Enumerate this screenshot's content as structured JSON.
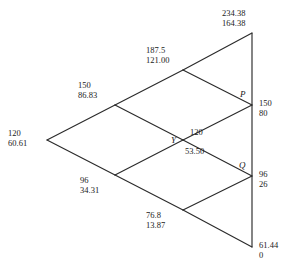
{
  "diagram": {
    "type": "binomial-lattice",
    "title": "",
    "edge_color": "#2b2b2b",
    "text_color": "#1a1a1a",
    "nodes": [
      {
        "id": "root",
        "name": "node-root",
        "x": 47,
        "y": 140,
        "value_top": "120",
        "value_bottom": "60.61",
        "label_x": 8,
        "label_y": 128,
        "point_label": "",
        "layout": "stacked"
      },
      {
        "id": "up1",
        "name": "node-up1",
        "x": 115,
        "y": 105,
        "value_top": "150",
        "value_bottom": "86.83",
        "label_x": 78,
        "label_y": 80,
        "point_label": "",
        "layout": "stacked"
      },
      {
        "id": "down1",
        "name": "node-down1",
        "x": 115,
        "y": 175,
        "value_top": "96",
        "value_bottom": "34.31",
        "label_x": 80,
        "label_y": 175,
        "point_label": "",
        "layout": "stacked"
      },
      {
        "id": "upup2",
        "name": "node-upup2",
        "x": 183,
        "y": 70,
        "value_top": "187.5",
        "value_bottom": "121.00",
        "label_x": 146,
        "label_y": 45,
        "point_label": "",
        "layout": "stacked"
      },
      {
        "id": "mid2",
        "name": "node-mid2-y",
        "x": 183,
        "y": 140,
        "value_top": "120",
        "value_bottom": "53.50",
        "label_x": 190,
        "label_y": 127,
        "point_label": "Y",
        "point_label_x": 171,
        "point_label_y": 135,
        "layout": "split"
      },
      {
        "id": "downdown2",
        "name": "node-downdown2",
        "x": 183,
        "y": 210,
        "value_top": "76.8",
        "value_bottom": "13.87",
        "label_x": 146,
        "label_y": 210,
        "point_label": "",
        "layout": "stacked"
      },
      {
        "id": "term-top",
        "name": "node-terminal-top",
        "x": 252,
        "y": 33,
        "value_top": "234.38",
        "value_bottom": "164.38",
        "label_x": 222,
        "label_y": 8,
        "point_label": "",
        "layout": "stacked"
      },
      {
        "id": "term-p",
        "name": "node-terminal-p",
        "x": 252,
        "y": 105,
        "value_top": "150",
        "value_bottom": "80",
        "label_x": 259,
        "label_y": 98,
        "point_label": "P",
        "point_label_x": 240,
        "point_label_y": 89,
        "layout": "stacked"
      },
      {
        "id": "term-q",
        "name": "node-terminal-q",
        "x": 252,
        "y": 176,
        "value_top": "96",
        "value_bottom": "26",
        "label_x": 259,
        "label_y": 169,
        "point_label": "Q",
        "point_label_x": 239,
        "point_label_y": 160,
        "layout": "stacked"
      },
      {
        "id": "term-bottom",
        "name": "node-terminal-bottom",
        "x": 252,
        "y": 247,
        "value_top": "61.44",
        "value_bottom": "0",
        "label_x": 259,
        "label_y": 240,
        "point_label": "",
        "layout": "stacked"
      }
    ],
    "edges": [
      {
        "name": "edge-root-up1",
        "from": "root",
        "to": "up1"
      },
      {
        "name": "edge-root-down1",
        "from": "root",
        "to": "down1"
      },
      {
        "name": "edge-up1-upup2",
        "from": "up1",
        "to": "upup2"
      },
      {
        "name": "edge-up1-mid2",
        "from": "up1",
        "to": "mid2"
      },
      {
        "name": "edge-down1-mid2",
        "from": "down1",
        "to": "mid2"
      },
      {
        "name": "edge-down1-downdown2",
        "from": "down1",
        "to": "downdown2"
      },
      {
        "name": "edge-upup2-termtop",
        "from": "upup2",
        "to": "term-top"
      },
      {
        "name": "edge-upup2-termp",
        "from": "upup2",
        "to": "term-p"
      },
      {
        "name": "edge-mid2-termp",
        "from": "mid2",
        "to": "term-p"
      },
      {
        "name": "edge-mid2-termq",
        "from": "mid2",
        "to": "term-q"
      },
      {
        "name": "edge-downdown2-termq",
        "from": "downdown2",
        "to": "term-q"
      },
      {
        "name": "edge-downdown2-termbottom",
        "from": "downdown2",
        "to": "term-bottom"
      },
      {
        "name": "edge-terminal-axis",
        "from": "term-top",
        "to": "term-bottom"
      }
    ]
  }
}
